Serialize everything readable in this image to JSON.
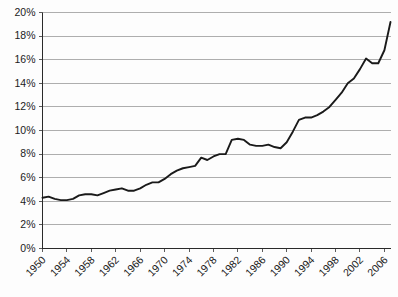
{
  "chart_data": {
    "type": "line",
    "title": "",
    "subtitle": "",
    "xlabel": "",
    "ylabel": "",
    "xlim": [
      1950,
      2007
    ],
    "ylim": [
      0,
      20
    ],
    "grid": "horizontal",
    "legend": "none",
    "y_tick_labels": [
      "20%",
      "18%",
      "16%",
      "14%",
      "12%",
      "10%",
      "8%",
      "6%",
      "4%",
      "2%",
      "0%"
    ],
    "y_tick_values": [
      20,
      18,
      16,
      14,
      12,
      10,
      8,
      6,
      4,
      2,
      0
    ],
    "y_tick_step": 2,
    "x_tick_labels": [
      "1950",
      "1954",
      "1958",
      "1962",
      "1966",
      "1970",
      "1974",
      "1978",
      "1982",
      "1986",
      "1990",
      "1994",
      "1998",
      "2002",
      "2006"
    ],
    "x_tick_values": [
      1950,
      1954,
      1958,
      1962,
      1966,
      1970,
      1974,
      1978,
      1982,
      1986,
      1990,
      1994,
      1998,
      2002,
      2006
    ],
    "x_tick_step": 4,
    "x_label_rotation_deg": -45,
    "series": [
      {
        "name": "",
        "color": "#1a1a1a",
        "x": [
          1950,
          1951,
          1952,
          1953,
          1954,
          1955,
          1956,
          1957,
          1958,
          1959,
          1960,
          1961,
          1962,
          1963,
          1964,
          1965,
          1966,
          1967,
          1968,
          1969,
          1970,
          1971,
          1972,
          1973,
          1974,
          1975,
          1976,
          1977,
          1978,
          1979,
          1980,
          1981,
          1982,
          1983,
          1984,
          1985,
          1986,
          1987,
          1988,
          1989,
          1990,
          1991,
          1992,
          1993,
          1994,
          1995,
          1996,
          1997,
          1998,
          1999,
          2000,
          2001,
          2002,
          2003,
          2004,
          2005,
          2006,
          2007
        ],
        "values": [
          4.3,
          4.4,
          4.2,
          4.1,
          4.1,
          4.2,
          4.5,
          4.6,
          4.6,
          4.5,
          4.7,
          4.9,
          5.0,
          5.1,
          4.9,
          4.9,
          5.1,
          5.4,
          5.6,
          5.6,
          5.9,
          6.3,
          6.6,
          6.8,
          6.9,
          7.0,
          7.7,
          7.5,
          7.8,
          8.0,
          8.0,
          9.2,
          9.3,
          9.2,
          8.8,
          8.7,
          8.7,
          8.8,
          8.6,
          8.5,
          9.0,
          9.9,
          10.9,
          11.1,
          11.1,
          11.3,
          11.6,
          12.0,
          12.6,
          13.2,
          14.0,
          14.4,
          15.2,
          16.1,
          15.7,
          15.7,
          16.8,
          19.2
        ]
      }
    ]
  },
  "axes": {
    "y_axis_name": "percent-axis",
    "x_axis_name": "year-axis"
  }
}
